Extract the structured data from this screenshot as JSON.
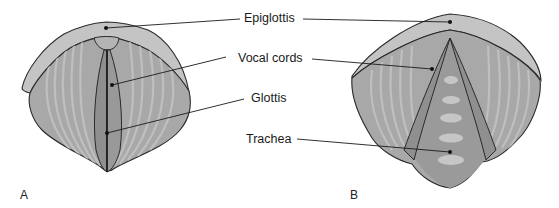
{
  "figure": {
    "labels": {
      "epiglottis": "Epiglottis",
      "vocal_cords": "Vocal cords",
      "glottis": "Glottis",
      "trachea": "Trachea"
    },
    "panels": [
      {
        "letter": "A",
        "view": "closed vocal cords"
      },
      {
        "letter": "B",
        "view": "open vocal cords"
      }
    ]
  },
  "colors": {
    "outline": "#2a2a2a",
    "epiglottis_fill": "#c4c4c4",
    "tissue_fill": "#a9a9a9",
    "tissue_stripe": "#c2c2c2",
    "cord_fill": "#8f8f8f",
    "trachea_fill": "#9a9a9a",
    "trachea_ring": "#c6c6c6",
    "leader": "#1a1a1a"
  }
}
